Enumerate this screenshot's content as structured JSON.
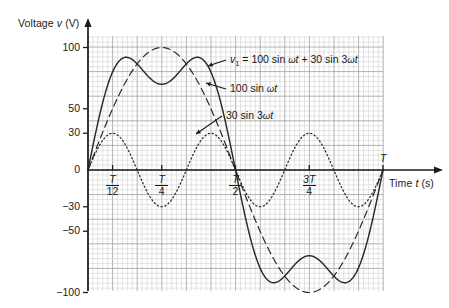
{
  "axes": {
    "y_title_prefix": "Voltage ",
    "y_title_var": "v",
    "y_title_unit": " (V)",
    "x_title_prefix": "Time ",
    "x_title_var": "t",
    "x_title_unit": " (s)",
    "period_label": "T"
  },
  "yticks": [
    {
      "value": 100,
      "label": "100"
    },
    {
      "value": 50,
      "label": "50"
    },
    {
      "value": 30,
      "label": "30"
    },
    {
      "value": 0,
      "label": "0"
    },
    {
      "value": -30,
      "label": "−30"
    },
    {
      "value": -50,
      "label": "−50"
    },
    {
      "value": -100,
      "label": "−100"
    }
  ],
  "xticks": [
    {
      "t": 0.0833333,
      "num": "T",
      "den": "12"
    },
    {
      "t": 0.25,
      "num": "T",
      "den": "4"
    },
    {
      "t": 0.5,
      "num": "T",
      "den": "2"
    },
    {
      "t": 0.75,
      "num": "3T",
      "den": "4"
    }
  ],
  "annotations": [
    {
      "name": "composite-label",
      "text": "v₁ = 100 sin ωt + 30 sin 3ωt"
    },
    {
      "name": "fundamental-label",
      "text": "100 sin ωt"
    },
    {
      "name": "harmonic-label",
      "text": "30 sin 3ωt"
    }
  ],
  "colors": {
    "ink": "#1a1a1a",
    "grid_minor": "#c9c9c9",
    "grid_major": "#9a9a9a",
    "curve": "#2a2a2a"
  },
  "chart_data": {
    "type": "line",
    "title": "",
    "xlabel": "Time t (s)",
    "ylabel": "Voltage v (V)",
    "xlim": [
      0,
      1
    ],
    "ylim": [
      -115,
      115
    ],
    "grid": true,
    "legend": "inline-annotations",
    "x_unit": "periods of T",
    "series": [
      {
        "name": "v₁ = 100 sin ωt + 30 sin 3ωt",
        "style": "solid",
        "amplitude_fundamental": 100,
        "amplitude_third": 30,
        "formula": "100*sin(2*pi*t) + 30*sin(6*pi*t)",
        "x": [
          0,
          0.0417,
          0.0833,
          0.125,
          0.1667,
          0.2083,
          0.25,
          0.2917,
          0.3333,
          0.375,
          0.4167,
          0.4583,
          0.5,
          0.5417,
          0.5833,
          0.625,
          0.6667,
          0.7083,
          0.75,
          0.7917,
          0.8333,
          0.875,
          0.9167,
          0.9583,
          1.0
        ],
        "y": [
          0,
          47.1,
          79.2,
          91.7,
          86.6,
          74.3,
          70,
          74.3,
          86.6,
          91.7,
          79.2,
          47.1,
          0,
          -47.1,
          -79.2,
          -91.7,
          -86.6,
          -74.3,
          -70,
          -74.3,
          -86.6,
          -91.7,
          -79.2,
          -47.1,
          0
        ]
      },
      {
        "name": "100 sin ωt",
        "style": "dashed",
        "amplitude": 100,
        "formula": "100*sin(2*pi*t)",
        "x": [
          0,
          0.0833,
          0.1667,
          0.25,
          0.3333,
          0.4167,
          0.5,
          0.5833,
          0.6667,
          0.75,
          0.8333,
          0.9167,
          1.0
        ],
        "y": [
          0,
          50,
          86.6,
          100,
          86.6,
          50,
          0,
          -50,
          -86.6,
          -100,
          -86.6,
          -50,
          0
        ]
      },
      {
        "name": "30 sin 3ωt",
        "style": "dotted",
        "amplitude": 30,
        "formula": "30*sin(6*pi*t)",
        "x": [
          0,
          0.0833,
          0.1667,
          0.25,
          0.3333,
          0.4167,
          0.5,
          0.5833,
          0.6667,
          0.75,
          0.8333,
          0.9167,
          1.0
        ],
        "y": [
          0,
          30,
          0,
          -30,
          0,
          30,
          0,
          -30,
          0,
          30,
          0,
          -30,
          0
        ]
      }
    ]
  }
}
